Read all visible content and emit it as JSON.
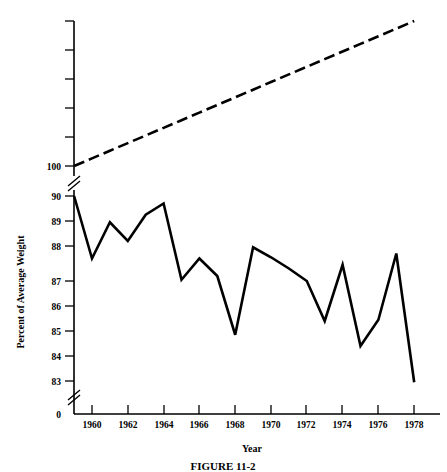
{
  "chart_data": {
    "type": "line",
    "title": "",
    "xlabel": "Year",
    "ylabel": "Percent of Average Weight",
    "grid": false,
    "legend": "none",
    "xlim": [
      1959,
      1979
    ],
    "x_ticks": [
      1960,
      1962,
      1964,
      1966,
      1968,
      1970,
      1972,
      1974,
      1976,
      1978
    ],
    "x_tick_labels": [
      "1960",
      "1962",
      "1964",
      "1966",
      "1968",
      "1970",
      "1972",
      "1974",
      "1976",
      "1978"
    ],
    "y_tick_labels": [
      "0",
      "83",
      "84",
      "85",
      "86",
      "87",
      "88",
      "89",
      "90",
      "100"
    ],
    "y_axis_note": "broken axis: gap between 0 and 83, and between 90 and 100",
    "y_lower_range": [
      83,
      90
    ],
    "y_upper_range": [
      100,
      105
    ],
    "x": [
      1959,
      1960,
      1961,
      1962,
      1963,
      1964,
      1965,
      1966,
      1967,
      1968,
      1969,
      1970,
      1971,
      1972,
      1973,
      1974,
      1975,
      1976,
      1977,
      1978
    ],
    "series": [
      {
        "name": "observed-weight-percent",
        "style": "solid",
        "values": [
          90.0,
          87.5,
          88.95,
          88.2,
          89.25,
          89.7,
          86.65,
          87.5,
          86.8,
          84.45,
          87.95,
          87.55,
          87.1,
          86.6,
          85.0,
          87.25,
          84.0,
          85.05,
          87.7,
          82.55
        ]
      },
      {
        "name": "reference-trend",
        "style": "dashed",
        "values": [
          100.0,
          100.3,
          100.6,
          100.9,
          101.2,
          101.5,
          101.8,
          102.1,
          102.4,
          102.7,
          103.0,
          103.3,
          103.6,
          103.9,
          104.2,
          104.5,
          104.8,
          105.1,
          105.4,
          105.7
        ]
      }
    ]
  },
  "axes": {
    "y_label": "Percent of Average Weight",
    "x_label": "Year",
    "origin_label": "0",
    "y_labels": {
      "v100": "100",
      "v90": "90",
      "v89": "89",
      "v88": "88",
      "v87": "87",
      "v86": "86",
      "v85": "85",
      "v84": "84",
      "v83": "83",
      "v0": "0"
    },
    "x_labels": {
      "t1960": "1960",
      "t1962": "1962",
      "t1964": "1964",
      "t1966": "1966",
      "t1968": "1968",
      "t1970": "1970",
      "t1972": "1972",
      "t1974": "1974",
      "t1976": "1976",
      "t1978": "1978"
    }
  },
  "caption": {
    "text": "FIGURE 11-2"
  },
  "colors": {
    "ink": "#000000",
    "background": "#ffffff"
  }
}
